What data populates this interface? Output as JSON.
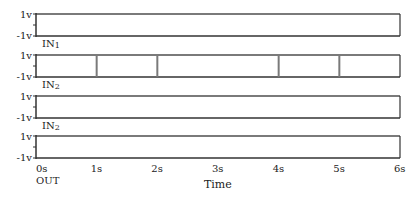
{
  "diagram": {
    "type": "timing-diagram",
    "x_axis": {
      "title": "Time",
      "ticks": [
        "0s",
        "1s",
        "2s",
        "3s",
        "4s",
        "5s",
        "6s"
      ],
      "range": [
        0,
        6
      ]
    },
    "y_labels": {
      "high": "1v",
      "low": "-1v"
    },
    "rows": [
      {
        "label": "IN",
        "subscript": "1",
        "transitions": []
      },
      {
        "label": "IN",
        "subscript": "2",
        "transitions": [
          1,
          2,
          4,
          5
        ]
      },
      {
        "label": "IN",
        "subscript": "2",
        "transitions": []
      },
      {
        "label": "OUT",
        "subscript": "",
        "transitions": []
      }
    ],
    "colors": {
      "line": "#333333",
      "box_edge": "#7a7a7a"
    }
  }
}
